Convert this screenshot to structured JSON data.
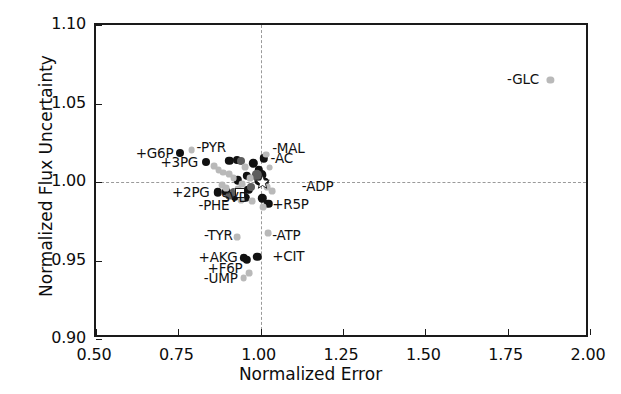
{
  "chart_data": {
    "type": "scatter",
    "title": "",
    "xlabel": "Normalized Error",
    "ylabel": "Normalized Flux Uncertainty",
    "xlim": [
      0.5,
      2.0
    ],
    "ylim": [
      0.9,
      1.1
    ],
    "xticks": [
      "0.50",
      "0.75",
      "1.00",
      "1.25",
      "1.50",
      "1.75",
      "2.00"
    ],
    "xtick_values": [
      0.5,
      0.75,
      1.0,
      1.25,
      1.5,
      1.75,
      2.0
    ],
    "yticks": [
      "0.90",
      "0.95",
      "1.00",
      "1.05",
      "1.10"
    ],
    "ytick_values": [
      0.9,
      0.95,
      1.0,
      1.05,
      1.1
    ],
    "grid": false,
    "legend": "none",
    "reference_lines": [
      {
        "orientation": "vertical",
        "value": 1.0,
        "style": "dashed",
        "color": "#9a9a9a"
      },
      {
        "orientation": "horizontal",
        "value": 1.0,
        "style": "dashed",
        "color": "#9a9a9a"
      }
    ],
    "reference_marker": {
      "x": 1.005,
      "y": 0.9995,
      "shape": "star",
      "color": "#ffffff",
      "edge": "#1a1a1a"
    },
    "annotations": [
      {
        "text": "-GLC",
        "x": 1.845,
        "y": 1.0655,
        "align": "right"
      },
      {
        "text": "+G6P",
        "x": 0.735,
        "y": 1.0185,
        "align": "right"
      },
      {
        "text": "-PYR",
        "x": 0.805,
        "y": 1.022,
        "align": "left"
      },
      {
        "text": "+3PG",
        "x": 0.81,
        "y": 1.0125,
        "align": "right"
      },
      {
        "text": "-MAL",
        "x": 1.035,
        "y": 1.0215,
        "align": "left"
      },
      {
        "text": "-AC",
        "x": 1.03,
        "y": 1.015,
        "align": "left"
      },
      {
        "text": "-ADP",
        "x": 1.125,
        "y": 0.9975,
        "align": "left"
      },
      {
        "text": "+2PG",
        "x": 0.845,
        "y": 0.9935,
        "align": "right"
      },
      {
        "text": "SVD",
        "x": 0.88,
        "y": 0.9905,
        "align": "left"
      },
      {
        "text": "-PHE",
        "x": 0.905,
        "y": 0.9855,
        "align": "right"
      },
      {
        "text": "+R5P",
        "x": 1.035,
        "y": 0.986,
        "align": "left"
      },
      {
        "text": "-TYR",
        "x": 0.915,
        "y": 0.966,
        "align": "right"
      },
      {
        "text": "-ATP",
        "x": 1.035,
        "y": 0.966,
        "align": "left"
      },
      {
        "text": "+AKG",
        "x": 0.93,
        "y": 0.952,
        "align": "right"
      },
      {
        "text": "+CIT",
        "x": 1.035,
        "y": 0.953,
        "align": "left"
      },
      {
        "text": "+F6P",
        "x": 0.945,
        "y": 0.945,
        "align": "right"
      },
      {
        "text": "-UMP",
        "x": 0.93,
        "y": 0.939,
        "align": "right"
      }
    ],
    "series": [
      {
        "name": "dark-points",
        "color": "#111111",
        "points": [
          {
            "x": 0.755,
            "y": 1.0185,
            "r": 4.0
          },
          {
            "x": 0.835,
            "y": 1.0125,
            "r": 4.0
          },
          {
            "x": 0.905,
            "y": 1.0135,
            "r": 4.2
          },
          {
            "x": 0.928,
            "y": 1.0142,
            "r": 4.0
          },
          {
            "x": 0.978,
            "y": 1.012,
            "r": 4.2
          },
          {
            "x": 1.01,
            "y": 1.015,
            "r": 4.2
          },
          {
            "x": 0.995,
            "y": 1.0075,
            "r": 4.2
          },
          {
            "x": 0.958,
            "y": 1.0038,
            "r": 4.2
          },
          {
            "x": 0.93,
            "y": 1.001,
            "r": 4.2
          },
          {
            "x": 0.995,
            "y": 1.0005,
            "r": 4.6
          },
          {
            "x": 1.012,
            "y": 1.0,
            "r": 4.2
          },
          {
            "x": 0.962,
            "y": 0.995,
            "r": 4.2
          },
          {
            "x": 0.896,
            "y": 0.9938,
            "r": 4.2
          },
          {
            "x": 0.869,
            "y": 0.9935,
            "r": 4.2
          },
          {
            "x": 0.922,
            "y": 0.9905,
            "r": 4.2
          },
          {
            "x": 0.953,
            "y": 0.99,
            "r": 4.2
          },
          {
            "x": 1.005,
            "y": 0.9895,
            "r": 4.2
          },
          {
            "x": 1.023,
            "y": 0.9862,
            "r": 4.2
          },
          {
            "x": 0.99,
            "y": 0.9525,
            "r": 4.2
          },
          {
            "x": 0.948,
            "y": 0.9518,
            "r": 4.2
          },
          {
            "x": 0.958,
            "y": 0.9505,
            "r": 4.2
          },
          {
            "x": 1.0,
            "y": 1.0043,
            "r": 5.6
          }
        ]
      },
      {
        "name": "mid-gray-points",
        "color": "#5d5d5d",
        "points": [
          {
            "x": 0.94,
            "y": 1.0135,
            "r": 4.0
          },
          {
            "x": 0.972,
            "y": 0.997,
            "r": 4.0
          },
          {
            "x": 0.918,
            "y": 0.9935,
            "r": 4.0
          },
          {
            "x": 0.988,
            "y": 1.0042,
            "r": 5.2
          },
          {
            "x": 0.905,
            "y": 0.9912,
            "r": 3.6
          }
        ]
      },
      {
        "name": "light-gray-points",
        "color": "#b9b9b9",
        "points": [
          {
            "x": 1.88,
            "y": 1.065,
            "r": 3.6
          },
          {
            "x": 0.79,
            "y": 1.0205,
            "r": 3.4
          },
          {
            "x": 0.858,
            "y": 1.01,
            "r": 3.4
          },
          {
            "x": 0.872,
            "y": 1.0078,
            "r": 3.4
          },
          {
            "x": 0.885,
            "y": 1.006,
            "r": 3.4
          },
          {
            "x": 0.952,
            "y": 1.0095,
            "r": 3.4
          },
          {
            "x": 0.905,
            "y": 1.0048,
            "r": 3.4
          },
          {
            "x": 0.918,
            "y": 1.0026,
            "r": 3.4
          },
          {
            "x": 1.016,
            "y": 1.0175,
            "r": 3.4
          },
          {
            "x": 1.027,
            "y": 1.0092,
            "r": 3.4
          },
          {
            "x": 0.968,
            "y": 1.0025,
            "r": 3.4
          },
          {
            "x": 0.944,
            "y": 0.9988,
            "r": 3.4
          },
          {
            "x": 0.882,
            "y": 0.998,
            "r": 3.4
          },
          {
            "x": 0.895,
            "y": 0.9962,
            "r": 3.4
          },
          {
            "x": 0.932,
            "y": 0.9955,
            "r": 3.4
          },
          {
            "x": 1.02,
            "y": 0.9965,
            "r": 3.4
          },
          {
            "x": 1.035,
            "y": 0.994,
            "r": 3.4
          },
          {
            "x": 0.94,
            "y": 0.9885,
            "r": 3.4
          },
          {
            "x": 0.975,
            "y": 0.988,
            "r": 3.4
          },
          {
            "x": 1.008,
            "y": 0.9838,
            "r": 3.4
          },
          {
            "x": 0.928,
            "y": 0.965,
            "r": 3.4
          },
          {
            "x": 1.022,
            "y": 0.9672,
            "r": 3.4
          },
          {
            "x": 0.966,
            "y": 0.942,
            "r": 3.4
          },
          {
            "x": 0.948,
            "y": 0.939,
            "r": 3.4
          }
        ]
      },
      {
        "name": "svd-marker",
        "color": "#ffffff",
        "edge": "#1a1a1a",
        "shape": "square",
        "points": [
          {
            "x": 0.938,
            "y": 0.993,
            "r": 4.0
          }
        ]
      }
    ]
  }
}
